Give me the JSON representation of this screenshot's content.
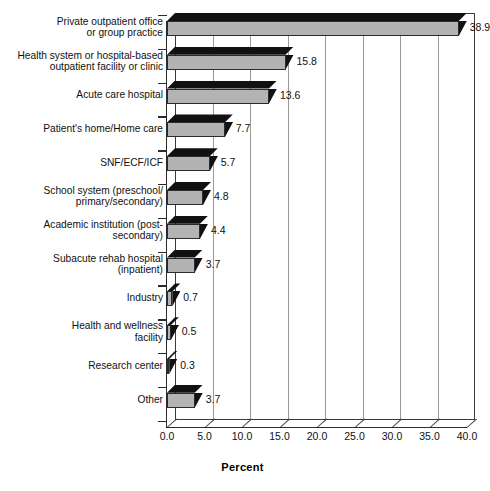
{
  "chart_data": {
    "type": "bar",
    "orientation": "horizontal",
    "title": "",
    "xlabel": "Percent",
    "ylabel": "",
    "xlim": [
      0.0,
      40.0
    ],
    "xtick_step": 5.0,
    "xticks": [
      "0.0",
      "5.0",
      "10.0",
      "15.0",
      "20.0",
      "25.0",
      "30.0",
      "35.0",
      "40.0"
    ],
    "grid": true,
    "grid_axis": "x",
    "legend": false,
    "style": "3d-bar",
    "colors": {
      "bar_front": "#b3b3b3",
      "bar_top": "#111111",
      "bar_side": "#111111",
      "axis": "#2b2b2b",
      "gridline": "#9a9a9a",
      "background": "#ffffff"
    },
    "categories": [
      "Private outpatient office or group practice",
      "Health system or hospital-based outpatient facility or clinic",
      "Acute care hospital",
      "Patient's home/Home care",
      "SNF/ECF/ICF",
      "School system (preschool/primary/secondary)",
      "Academic institution (post-secondary)",
      "Subacute rehab hospital (inpatient)",
      "Industry",
      "Health and wellness facility",
      "Research center",
      "Other"
    ],
    "category_lines": [
      [
        "Private outpatient office",
        "or group practice"
      ],
      [
        "Health system or hospital-based",
        "outpatient facility or clinic"
      ],
      [
        "Acute care hospital"
      ],
      [
        "Patient's home/Home care"
      ],
      [
        "SNF/ECF/ICF"
      ],
      [
        "School system (preschool/",
        "primary/secondary)"
      ],
      [
        "Academic institution (post-",
        "secondary)"
      ],
      [
        "Subacute rehab hospital",
        "(inpatient)"
      ],
      [
        "Industry"
      ],
      [
        "Health and wellness",
        "facility"
      ],
      [
        "Research center"
      ],
      [
        "Other"
      ]
    ],
    "values": [
      38.9,
      15.8,
      13.6,
      7.7,
      5.7,
      4.8,
      4.4,
      3.7,
      0.7,
      0.5,
      0.3,
      3.7
    ],
    "value_labels": [
      "38.9",
      "15.8",
      "13.6",
      "7.7",
      "5.7",
      "4.8",
      "4.4",
      "3.7",
      "0.7",
      "0.5",
      "0.3",
      "3.7"
    ]
  }
}
